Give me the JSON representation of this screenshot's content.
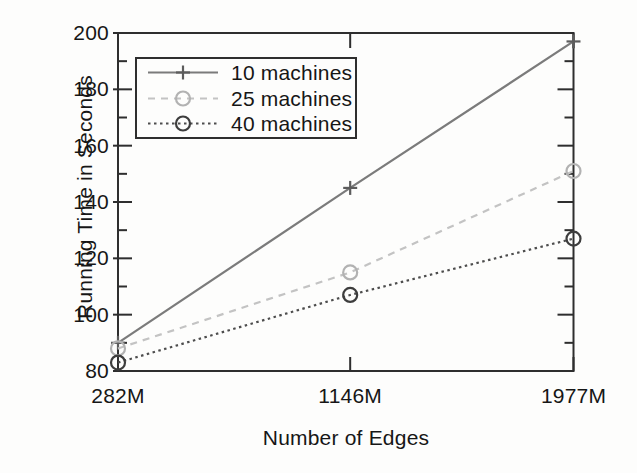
{
  "figure": {
    "background": "#fdfdfc"
  },
  "chart_data": {
    "type": "line",
    "title": "",
    "xlabel": "Number of Edges",
    "ylabel": "Running Time in Seconds",
    "categories": [
      "282M",
      "1146M",
      "1977M"
    ],
    "x_values": [
      282,
      1146,
      1977
    ],
    "xlim": [
      282,
      1977
    ],
    "ylim": [
      80,
      200
    ],
    "y_ticks": [
      80,
      100,
      120,
      140,
      160,
      180,
      200
    ],
    "y_minor_step": 10,
    "grid": false,
    "legend_position": "top-left-inside",
    "axis_color": "#2e2e2e",
    "text_color": "#161616",
    "series": [
      {
        "name": "10 machines",
        "values": [
          90,
          145,
          197
        ],
        "color": "#7b7b7b",
        "marker_color": "#5c5c5c",
        "line_style": "solid",
        "marker": "plus"
      },
      {
        "name": "25 machines",
        "values": [
          88,
          115,
          151
        ],
        "color": "#c3c3c3",
        "marker_color": "#b2b2b2",
        "line_style": "dashed",
        "marker": "circle"
      },
      {
        "name": "40 machines",
        "values": [
          83,
          107,
          127
        ],
        "color": "#4d4d4d",
        "marker_color": "#3d3d3d",
        "line_style": "dotted",
        "marker": "circle"
      }
    ]
  }
}
